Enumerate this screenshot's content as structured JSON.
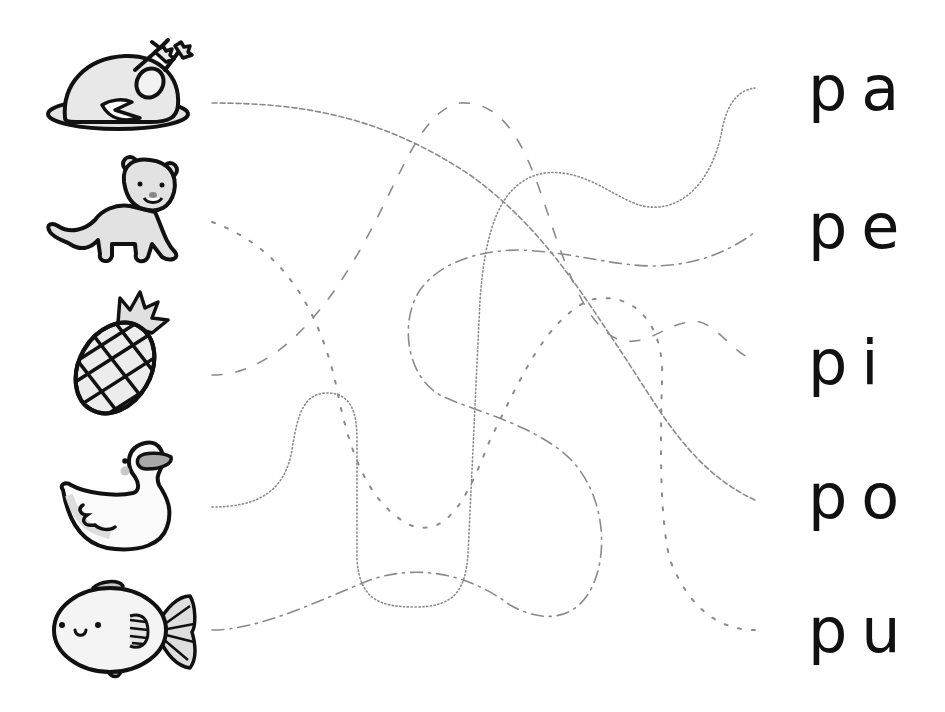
{
  "worksheet": {
    "type": "match-the-picture-to-syllable tracing worksheet",
    "pictures": [
      {
        "id": "turkey",
        "label": "roasted turkey (pavo)",
        "y": 103
      },
      {
        "id": "cat",
        "label": "puma / big cat",
        "y": 222
      },
      {
        "id": "pineapple",
        "label": "pineapple (piña)",
        "y": 375
      },
      {
        "id": "duck",
        "label": "duck (pato)",
        "y": 507
      },
      {
        "id": "fish",
        "label": "fish (pez)",
        "y": 630
      }
    ],
    "syllables": [
      {
        "text": "pa",
        "y": 90
      },
      {
        "text": "pe",
        "y": 230
      },
      {
        "text": "pi",
        "y": 363
      },
      {
        "text": "po",
        "y": 497
      },
      {
        "text": "pu",
        "y": 632
      }
    ],
    "traces": [
      {
        "from": "turkey",
        "to": "po",
        "style": "fine-dashed"
      },
      {
        "from": "cat",
        "to": "pu",
        "style": "spaced-dash"
      },
      {
        "from": "pineapple",
        "to": "pi",
        "style": "long-dash"
      },
      {
        "from": "duck",
        "to": "pa",
        "style": "dotted"
      },
      {
        "from": "fish",
        "to": "pe",
        "style": "dash-dot"
      }
    ],
    "colors": {
      "line": "#8a8a8a",
      "outline": "#111111",
      "shade": "#d6d6d6",
      "text": "#111111"
    }
  }
}
